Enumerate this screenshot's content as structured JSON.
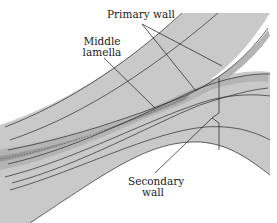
{
  "diagram": {
    "labels": {
      "primary_wall": "Primary wall",
      "middle_lamella_line1": "Middle",
      "middle_lamella_line2": "lamella",
      "secondary_wall_line1": "Secondary",
      "secondary_wall_line2": "wall"
    },
    "colors": {
      "background": "#ffffff",
      "secondary_wall_fill": "#c9c9c9",
      "primary_wall_fill": "#b4b4b4",
      "middle_lamella_fill": "#9a9a9a",
      "outline": "#2a2a2a"
    }
  }
}
